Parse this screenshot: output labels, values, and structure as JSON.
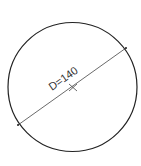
{
  "diagram": {
    "shape": "circle",
    "dimension_label": "D=140",
    "center_marker": "cross",
    "colors": {
      "outline": "#222222",
      "dimension_line": "#444444",
      "text": "#333333"
    }
  }
}
